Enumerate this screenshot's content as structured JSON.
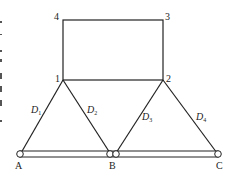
{
  "diagram": {
    "type": "truss / support structure schematic",
    "nodes": {
      "n1": {
        "label": "1",
        "x": 63,
        "y": 80
      },
      "n2": {
        "label": "2",
        "x": 163,
        "y": 80
      },
      "n3": {
        "label": "3",
        "x": 163,
        "y": 20
      },
      "n4": {
        "label": "4",
        "x": 63,
        "y": 20
      },
      "A": {
        "label": "A",
        "x": 20,
        "y": 154
      },
      "B": {
        "label": "B",
        "x": 113,
        "y": 154
      },
      "C": {
        "label": "C",
        "x": 218,
        "y": 154
      }
    },
    "members": [
      {
        "name": "D",
        "sub": "1",
        "from": "1",
        "to": "A"
      },
      {
        "name": "D",
        "sub": "2",
        "from": "1",
        "to": "B"
      },
      {
        "name": "D",
        "sub": "3",
        "from": "2",
        "to": "B"
      },
      {
        "name": "D",
        "sub": "4",
        "from": "2",
        "to": "C"
      }
    ],
    "frame_edges": [
      "4-3",
      "3-2",
      "2-1",
      "1-4"
    ],
    "base_bar": {
      "from": "A",
      "to": "C"
    },
    "colors": {
      "line": "#222222",
      "background": "#ffffff"
    }
  }
}
